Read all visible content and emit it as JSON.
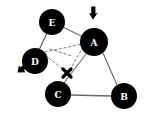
{
  "diagram": {
    "background_color": "#ffffff",
    "node_fill": "#000000",
    "node_label_color": "#ffffff",
    "edge_color": "#555555",
    "dashed_color": "#777777",
    "mark_color": "#000000",
    "nodes": [
      {
        "id": "E",
        "label": "E",
        "cx": 52,
        "cy": 22,
        "r": 13
      },
      {
        "id": "A",
        "label": "A",
        "cx": 94,
        "cy": 42,
        "r": 14
      },
      {
        "id": "D",
        "label": "D",
        "cx": 35,
        "cy": 61,
        "r": 13
      },
      {
        "id": "C",
        "label": "C",
        "cx": 58,
        "cy": 94,
        "r": 13
      },
      {
        "id": "B",
        "label": "B",
        "cx": 124,
        "cy": 96,
        "r": 13
      }
    ],
    "edges": [
      {
        "from": "E",
        "to": "D",
        "style": "solid"
      },
      {
        "from": "A",
        "to": "C",
        "style": "solid"
      },
      {
        "from": "A",
        "to": "B",
        "style": "solid"
      },
      {
        "from": "C",
        "to": "B",
        "style": "solid"
      },
      {
        "from": "E",
        "to": "A",
        "style": "solid"
      }
    ],
    "dashed_edges": [
      {
        "from": "D",
        "to": "A",
        "style": "dashed"
      },
      {
        "from": "D",
        "to": "X",
        "style": "dashed"
      },
      {
        "from": "A",
        "to": "X",
        "style": "dashed"
      }
    ],
    "markers": [
      {
        "type": "cross-mark",
        "label": "x",
        "cx": 67,
        "cy": 73,
        "size": 9
      }
    ],
    "arrows": [
      {
        "type": "arrow-down-at-a",
        "x": 92,
        "y": 12,
        "direction": "down"
      },
      {
        "type": "arrow-down-left-at-d",
        "x": 21,
        "y": 70,
        "direction": "down-left"
      }
    ]
  }
}
